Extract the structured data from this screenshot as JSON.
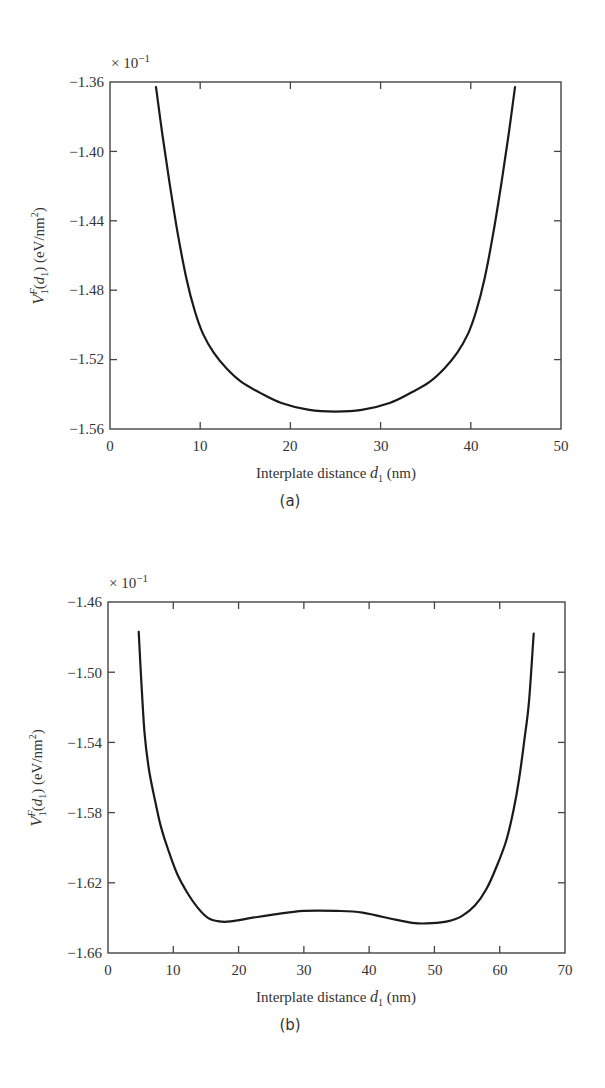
{
  "chart_data": [
    {
      "type": "line",
      "panel_label": "(a)",
      "title": "",
      "xlabel": "Interplate distance d1 (nm)",
      "xlabel_parts": {
        "pre": "Interplate distance ",
        "var": "d",
        "sub": "1",
        "post": " (nm)"
      },
      "ylabel": "V1^F(d1) (eV/nm^2)",
      "y_multiplier": "× 10^-1",
      "xlim": [
        0,
        50
      ],
      "ylim": [
        -1.56,
        -1.36
      ],
      "xticks": [
        0,
        10,
        20,
        30,
        40,
        50
      ],
      "xtick_labels": [
        "0",
        "10",
        "20",
        "30",
        "40",
        "50"
      ],
      "yticks": [
        -1.36,
        -1.4,
        -1.44,
        -1.48,
        -1.52,
        -1.56
      ],
      "ytick_labels": [
        "-1.36",
        "-1.40",
        "-1.44",
        "-1.48",
        "-1.52",
        "-1.56"
      ],
      "grid": false,
      "series": [
        {
          "name": "V1F",
          "x": [
            5.1,
            5.8,
            6.6,
            7.5,
            8.5,
            9.4,
            10.3,
            11.5,
            12.9,
            14.6,
            16.6,
            19.0,
            22.1,
            25.0,
            27.9,
            31.0,
            33.4,
            35.4,
            37.1,
            38.5,
            39.7,
            40.6,
            41.5,
            42.5,
            43.4,
            44.2,
            44.9
          ],
          "y": [
            -1.363,
            -1.39,
            -1.418,
            -1.447,
            -1.474,
            -1.492,
            -1.505,
            -1.516,
            -1.525,
            -1.533,
            -1.539,
            -1.545,
            -1.549,
            -1.55,
            -1.549,
            -1.545,
            -1.539,
            -1.533,
            -1.525,
            -1.516,
            -1.505,
            -1.492,
            -1.474,
            -1.447,
            -1.418,
            -1.39,
            -1.363
          ]
        }
      ]
    },
    {
      "type": "line",
      "panel_label": "(b)",
      "title": "",
      "xlabel": "Interplate distance d1 (nm)",
      "xlabel_parts": {
        "pre": "Interplate distance ",
        "var": "d",
        "sub": "1",
        "post": " (nm)"
      },
      "ylabel": "V1^F(d1) (eV/nm^2)",
      "y_multiplier": "× 10^-1",
      "xlim": [
        0,
        70
      ],
      "ylim": [
        -1.66,
        -1.46
      ],
      "xticks": [
        0,
        10,
        20,
        30,
        40,
        50,
        60,
        70
      ],
      "xtick_labels": [
        "0",
        "10",
        "20",
        "30",
        "40",
        "50",
        "60",
        "70"
      ],
      "yticks": [
        -1.46,
        -1.5,
        -1.54,
        -1.58,
        -1.62,
        -1.66
      ],
      "ytick_labels": [
        "-1.46",
        "-1.50",
        "-1.54",
        "-1.58",
        "-1.62",
        "-1.66"
      ],
      "grid": false,
      "series": [
        {
          "name": "V1F",
          "x": [
            4.7,
            5.1,
            5.6,
            6.3,
            7.2,
            8.1,
            9.2,
            10.6,
            12.2,
            13.7,
            15.3,
            17.0,
            18.8,
            22.0,
            25.5,
            30.0,
            35.0,
            39.0,
            44.0,
            47.0,
            49.6,
            52.0,
            54.2,
            56.2,
            57.9,
            59.5,
            61.0,
            62.1,
            63.0,
            63.8,
            64.5,
            65.2
          ],
          "y": [
            -1.477,
            -1.505,
            -1.535,
            -1.556,
            -1.573,
            -1.588,
            -1.601,
            -1.615,
            -1.626,
            -1.634,
            -1.64,
            -1.642,
            -1.642,
            -1.64,
            -1.638,
            -1.636,
            -1.636,
            -1.637,
            -1.641,
            -1.643,
            -1.643,
            -1.642,
            -1.639,
            -1.633,
            -1.624,
            -1.611,
            -1.596,
            -1.579,
            -1.56,
            -1.538,
            -1.516,
            -1.478
          ]
        }
      ]
    }
  ],
  "panels": [
    {
      "multiplier_base": "× 10",
      "multiplier_exp": "−1",
      "ylabel_parts": {
        "V": "V",
        "sup": "F",
        "sub": "1",
        "arg_open": "(",
        "arg_var": "d",
        "arg_sub": "1",
        "arg_close": ")",
        "unit": " (eV/nm",
        "unit_sup": "2",
        "unit_close": ")"
      },
      "xlabel_pre": "Interplate distance ",
      "xlabel_var": "d",
      "xlabel_sub": "1",
      "xlabel_post": " (nm)",
      "caption": "(a)",
      "ytick_labels": [
        "−1.36",
        "−1.40",
        "−1.44",
        "−1.48",
        "−1.52",
        "−1.56"
      ],
      "xtick_labels": [
        "0",
        "10",
        "20",
        "30",
        "40",
        "50"
      ]
    },
    {
      "multiplier_base": "× 10",
      "multiplier_exp": "−1",
      "ylabel_parts": {
        "V": "V",
        "sup": "F",
        "sub": "1",
        "arg_open": "(",
        "arg_var": "d",
        "arg_sub": "1",
        "arg_close": ")",
        "unit": " (eV/nm",
        "unit_sup": "2",
        "unit_close": ")"
      },
      "xlabel_pre": "Interplate distance ",
      "xlabel_var": "d",
      "xlabel_sub": "1",
      "xlabel_post": " (nm)",
      "caption": "(b)",
      "ytick_labels": [
        "−1.46",
        "−1.50",
        "−1.54",
        "−1.58",
        "−1.62",
        "−1.66"
      ],
      "xtick_labels": [
        "0",
        "10",
        "20",
        "30",
        "40",
        "50",
        "60",
        "70"
      ]
    }
  ]
}
